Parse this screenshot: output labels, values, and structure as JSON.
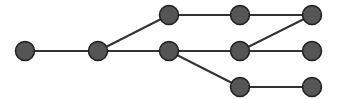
{
  "diagram": {
    "type": "tree-graph",
    "colors": {
      "node_fill": "#555555",
      "node_stroke": "#1f1f1f",
      "edge": "#333333",
      "background": "#ffffff"
    },
    "node_radius": 9.5,
    "nodes": [
      {
        "id": "n1",
        "x": 25,
        "y": 51
      },
      {
        "id": "n2",
        "x": 98,
        "y": 51
      },
      {
        "id": "n3",
        "x": 169,
        "y": 15
      },
      {
        "id": "n4",
        "x": 169,
        "y": 51
      },
      {
        "id": "n5",
        "x": 240,
        "y": 15
      },
      {
        "id": "n6",
        "x": 240,
        "y": 51
      },
      {
        "id": "n7",
        "x": 240,
        "y": 87
      },
      {
        "id": "n8",
        "x": 312,
        "y": 15
      },
      {
        "id": "n9",
        "x": 312,
        "y": 51
      },
      {
        "id": "n10",
        "x": 312,
        "y": 87
      }
    ],
    "edges": [
      [
        "n1",
        "n2"
      ],
      [
        "n2",
        "n3"
      ],
      [
        "n2",
        "n4"
      ],
      [
        "n3",
        "n5"
      ],
      [
        "n5",
        "n8"
      ],
      [
        "n4",
        "n6"
      ],
      [
        "n6",
        "n8"
      ],
      [
        "n6",
        "n9"
      ],
      [
        "n4",
        "n7"
      ],
      [
        "n7",
        "n10"
      ]
    ]
  }
}
